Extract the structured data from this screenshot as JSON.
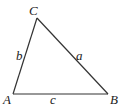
{
  "diagram": {
    "type": "triangle",
    "vertices": [
      {
        "id": "A",
        "label": "A",
        "x": 13,
        "y": 94,
        "lx": 3,
        "ly": 104
      },
      {
        "id": "B",
        "label": "B",
        "x": 108,
        "y": 94,
        "lx": 110,
        "ly": 104
      },
      {
        "id": "C",
        "label": "C",
        "x": 37,
        "y": 18,
        "lx": 29,
        "ly": 15
      }
    ],
    "sides": [
      {
        "id": "a",
        "label": "a",
        "from": "B",
        "to": "C",
        "lx": 76,
        "ly": 60
      },
      {
        "id": "b",
        "label": "b",
        "from": "A",
        "to": "C",
        "lx": 16,
        "ly": 60
      },
      {
        "id": "c",
        "label": "c",
        "from": "A",
        "to": "B",
        "lx": 50,
        "ly": 104
      }
    ],
    "colors": {
      "stroke": "#333333",
      "text": "#222222",
      "background": "#ffffff"
    }
  }
}
